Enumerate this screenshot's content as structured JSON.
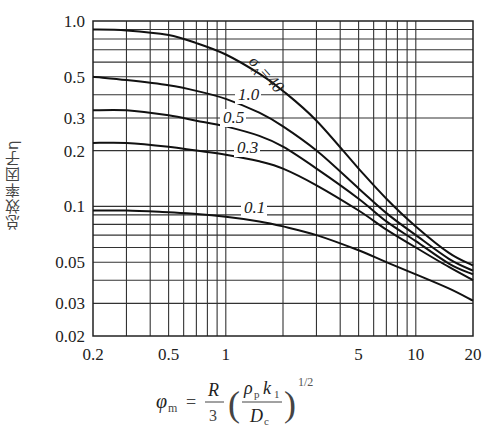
{
  "chart_data": {
    "type": "line",
    "title": "",
    "xlabel": "φm = (R/3)(ρp k1 / Dc)^(1/2)",
    "ylabel": "总效率因子η",
    "xscale": "log",
    "yscale": "log",
    "xlim": [
      0.2,
      20
    ],
    "ylim": [
      0.02,
      1.0
    ],
    "grid": true,
    "x_ticks": [
      "0.2",
      "0.5",
      "1",
      "5",
      "10",
      "20"
    ],
    "y_ticks": [
      "1.0",
      "0.5",
      "0.3",
      "0.2",
      "0.1",
      "0.05",
      "0.03",
      "0.02"
    ],
    "legend_param": "σA",
    "x": [
      0.2,
      0.3,
      0.5,
      0.7,
      1,
      1.5,
      2,
      3,
      5,
      7,
      10,
      15,
      20
    ],
    "series": [
      {
        "name": "σA=40",
        "label": "σA=40",
        "values": [
          0.9,
          0.89,
          0.84,
          0.76,
          0.66,
          0.52,
          0.42,
          0.29,
          0.16,
          0.11,
          0.078,
          0.056,
          0.048
        ]
      },
      {
        "name": "1.0",
        "label": "1.0",
        "values": [
          0.5,
          0.48,
          0.45,
          0.42,
          0.38,
          0.32,
          0.27,
          0.2,
          0.125,
          0.092,
          0.07,
          0.052,
          0.045
        ]
      },
      {
        "name": "0.5",
        "label": "0.5",
        "values": [
          0.33,
          0.33,
          0.31,
          0.29,
          0.27,
          0.24,
          0.21,
          0.16,
          0.11,
          0.083,
          0.065,
          0.049,
          0.043
        ]
      },
      {
        "name": "0.3",
        "label": "0.3",
        "values": [
          0.22,
          0.22,
          0.21,
          0.2,
          0.19,
          0.175,
          0.16,
          0.13,
          0.095,
          0.075,
          0.06,
          0.047,
          0.04
        ]
      },
      {
        "name": "0.1",
        "label": "0.1",
        "values": [
          0.095,
          0.095,
          0.093,
          0.091,
          0.088,
          0.083,
          0.078,
          0.07,
          0.058,
          0.05,
          0.043,
          0.036,
          0.031
        ]
      }
    ]
  },
  "labels": {
    "ylabel": "总效率因子η",
    "x_formula_lhs": "φ",
    "x_formula_lhs_sub": "m",
    "x_formula_eq": "=",
    "x_formula_num": "R",
    "x_formula_den": "3",
    "x_formula_inner_num": "ρ",
    "x_formula_inner_num_sub": "p",
    "x_formula_inner_num_k": "k",
    "x_formula_inner_num_k_sub": "1",
    "x_formula_inner_den": "D",
    "x_formula_inner_den_sub": "c",
    "x_formula_exp": "1/2"
  }
}
